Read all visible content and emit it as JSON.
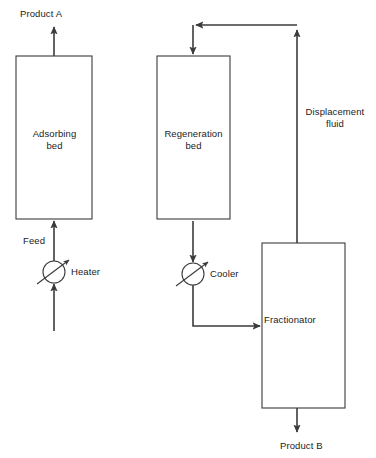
{
  "diagram": {
    "type": "process-flow-diagram",
    "canvas": {
      "width": 376,
      "height": 458
    },
    "colors": {
      "background": "#ffffff",
      "line": "#3b3b3b",
      "text": "#1c1c1c"
    },
    "units": [
      {
        "id": "adsorbing-bed",
        "label": "Adsorbing\nbed",
        "shape": "rectangle",
        "x": 16,
        "y": 56,
        "width": 76,
        "height": 163
      },
      {
        "id": "regeneration-bed",
        "label": "Regeneration\nbed",
        "shape": "rectangle",
        "x": 157,
        "y": 56,
        "width": 73,
        "height": 163
      },
      {
        "id": "fractionator",
        "label": "Fractionator",
        "shape": "rectangle",
        "x": 262,
        "y": 243,
        "width": 83,
        "height": 165
      },
      {
        "id": "heater",
        "label": "Heater",
        "shape": "circle-with-diagonal-arrow",
        "cx": 54,
        "cy": 272,
        "r": 11
      },
      {
        "id": "cooler",
        "label": "Cooler",
        "shape": "circle-with-diagonal-arrow",
        "cx": 193,
        "cy": 274,
        "r": 11
      }
    ],
    "streams": [
      {
        "id": "product-a",
        "label": "Product A",
        "direction": "up",
        "from": "adsorbing-bed-top",
        "to": "outlet"
      },
      {
        "id": "feed",
        "label": "Feed",
        "direction": "up",
        "from": "heater",
        "to": "adsorbing-bed-bottom"
      },
      {
        "id": "heater-inlet",
        "label": "",
        "direction": "up",
        "from": "inlet",
        "to": "heater"
      },
      {
        "id": "displacement-fluid",
        "label": "Displacement\nfluid",
        "direction": "up",
        "from": "fractionator-top",
        "to": "regeneration-bed-top"
      },
      {
        "id": "regeneration-outlet",
        "label": "",
        "direction": "down",
        "from": "regeneration-bed-bottom",
        "to": "cooler"
      },
      {
        "id": "cooler-to-fractionator",
        "label": "",
        "direction": "right",
        "from": "cooler",
        "to": "fractionator-left"
      },
      {
        "id": "product-b",
        "label": "Product B",
        "direction": "down",
        "from": "fractionator-bottom",
        "to": "outlet"
      }
    ]
  }
}
